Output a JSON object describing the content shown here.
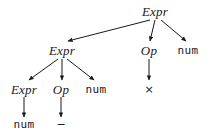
{
  "diagram": {
    "background_color": "#ffffff",
    "ink_color": "#1a1a1a",
    "width": 211,
    "height": 135
  },
  "nodes": [
    {
      "id": "n0",
      "label": "Expr",
      "kind": "nonterminal",
      "x": 155,
      "y": 11,
      "level": 0
    },
    {
      "id": "n1",
      "label": "Expr",
      "kind": "nonterminal",
      "x": 62,
      "y": 50,
      "level": 1
    },
    {
      "id": "n2",
      "label": "Op",
      "kind": "nonterminal",
      "x": 149,
      "y": 50,
      "level": 1
    },
    {
      "id": "n3",
      "label": "num",
      "kind": "terminal",
      "x": 188,
      "y": 50,
      "level": 1
    },
    {
      "id": "n4",
      "label": "Expr",
      "kind": "nonterminal",
      "x": 24,
      "y": 89,
      "level": 2
    },
    {
      "id": "n5",
      "label": "Op",
      "kind": "nonterminal",
      "x": 61,
      "y": 89,
      "level": 2
    },
    {
      "id": "n6",
      "label": "num",
      "kind": "terminal",
      "x": 96,
      "y": 89,
      "level": 2
    },
    {
      "id": "n7",
      "label": "×",
      "kind": "operator",
      "x": 149,
      "y": 89,
      "level": 2
    },
    {
      "id": "n8",
      "label": "num",
      "kind": "terminal",
      "x": 24,
      "y": 124,
      "level": 3
    },
    {
      "id": "n9",
      "label": "−",
      "kind": "operator",
      "x": 61,
      "y": 124,
      "level": 3
    }
  ],
  "edges": [
    {
      "from": "n0",
      "to": "n1",
      "x1": 150,
      "y1": 20,
      "x2": 68,
      "y2": 41
    },
    {
      "from": "n0",
      "to": "n2",
      "x1": 155,
      "y1": 20,
      "x2": 150,
      "y2": 41
    },
    {
      "from": "n0",
      "to": "n3",
      "x1": 161,
      "y1": 20,
      "x2": 186,
      "y2": 41
    },
    {
      "from": "n1",
      "to": "n4",
      "x1": 58,
      "y1": 59,
      "x2": 29,
      "y2": 80
    },
    {
      "from": "n1",
      "to": "n5",
      "x1": 62,
      "y1": 59,
      "x2": 62,
      "y2": 80
    },
    {
      "from": "n1",
      "to": "n6",
      "x1": 67,
      "y1": 59,
      "x2": 94,
      "y2": 80
    },
    {
      "from": "n2",
      "to": "n7",
      "x1": 149,
      "y1": 59,
      "x2": 149,
      "y2": 80
    },
    {
      "from": "n4",
      "to": "n8",
      "x1": 24,
      "y1": 97,
      "x2": 24,
      "y2": 117
    },
    {
      "from": "n5",
      "to": "n9",
      "x1": 61,
      "y1": 97,
      "x2": 61,
      "y2": 117
    }
  ]
}
